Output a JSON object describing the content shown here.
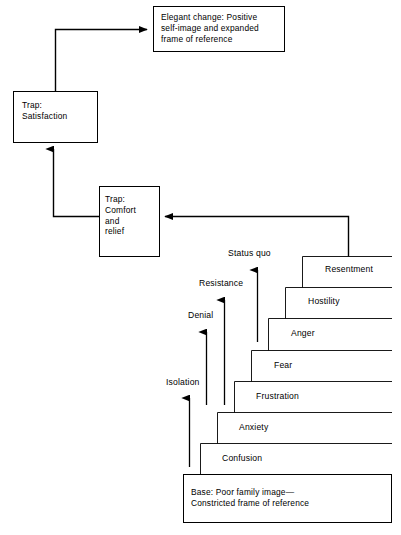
{
  "diagram": {
    "title_boxes": {
      "elegant_change": "Elegant change: Positive\nself-image and expanded\nframe of reference",
      "trap_satisfaction": "Trap:\nSatisfaction",
      "trap_comfort": "Trap:\n Comfort\nand\nrelief",
      "base": "Base: Poor family image—\nConstricted frame of reference"
    },
    "steps": [
      {
        "label": "Confusion"
      },
      {
        "label": "Anxiety"
      },
      {
        "label": "Frustration"
      },
      {
        "label": "Fear"
      },
      {
        "label": "Anger"
      },
      {
        "label": "Hostility"
      },
      {
        "label": "Resentment"
      }
    ],
    "stage_arrows": [
      {
        "label": "Isolation"
      },
      {
        "label": "Denial"
      },
      {
        "label": "Resistance"
      },
      {
        "label": "Status quo"
      }
    ],
    "colors": {
      "line": "#000000",
      "text": "#000000",
      "background": "#ffffff"
    }
  }
}
